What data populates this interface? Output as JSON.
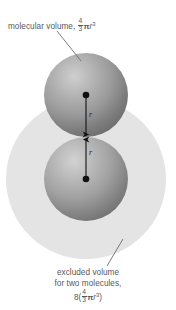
{
  "figure": {
    "name": "excluded-volume-diagram",
    "background_color": "#ffffff",
    "width": 176,
    "height": 310
  },
  "top_annotation": {
    "text_prefix": "molecular volume, ",
    "fraction_numerator": "4",
    "fraction_denominator": "3",
    "symbol_pi": "π",
    "variable": "r",
    "exponent": "3",
    "full_text": "molecular volume, 4/3πr³",
    "color": "#58585a"
  },
  "bottom_annotation": {
    "line1": "excluded volume",
    "line2": "for two molecules,",
    "formula_coefficient": "8",
    "paren_open": "(",
    "fraction_numerator": "4",
    "fraction_denominator": "3",
    "symbol_pi": "π",
    "variable": "r",
    "exponent": "3",
    "paren_close": ")",
    "full_text": "excluded volume for two molecules, 8(4/3πr³)",
    "color": "#58585a"
  },
  "radius_labels": {
    "upper": "r",
    "lower": "r",
    "color": "#232323"
  },
  "shapes": {
    "excluded_volume_circle": {
      "label": "excluded-volume-circle",
      "cx": 86,
      "cy": 179,
      "r": 80,
      "fill": "#e3e3e3"
    },
    "upper_sphere": {
      "label": "upper-molecule-sphere",
      "cx": 86,
      "cy": 95,
      "r": 42,
      "fill_light": "#b9b9b9",
      "fill_dark": "#6e6e6e",
      "highlight_x": 68,
      "highlight_y": 74
    },
    "lower_sphere": {
      "label": "lower-molecule-sphere",
      "cx": 86,
      "cy": 179,
      "r": 42,
      "fill_light": "#bdbdbd",
      "fill_dark": "#737373",
      "highlight_x": 68,
      "highlight_y": 158
    },
    "center_dot_upper": {
      "cx": 86,
      "cy": 95,
      "r": 3.2,
      "fill": "#111111"
    },
    "center_dot_lower": {
      "cx": 86,
      "cy": 179,
      "r": 3.2,
      "fill": "#111111"
    },
    "arrow_upper": {
      "x1": 86,
      "y1": 95,
      "x2": 86,
      "y2": 137,
      "color": "#111111"
    },
    "arrow_lower": {
      "x1": 86,
      "y1": 179,
      "x2": 86,
      "y2": 137,
      "color": "#111111"
    },
    "leader_top": {
      "x1": 57,
      "y1": 31,
      "x2": 81,
      "y2": 61,
      "color": "#58585a"
    },
    "leader_bottom": {
      "x1": 123,
      "y1": 239,
      "x2": 107,
      "y2": 266,
      "color": "#58585a"
    }
  }
}
